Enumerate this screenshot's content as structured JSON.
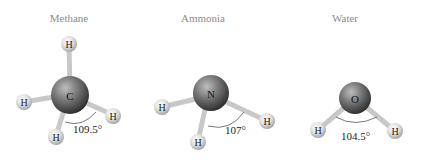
{
  "figure": {
    "molecules": [
      {
        "name": "Methane",
        "central_atom": "C",
        "hydrogen_label": "H",
        "bond_angle": "109.5°",
        "hydrogen_count": 4
      },
      {
        "name": "Ammonia",
        "central_atom": "N",
        "hydrogen_label": "H",
        "bond_angle": "107°",
        "hydrogen_count": 3
      },
      {
        "name": "Water",
        "central_atom": "O",
        "hydrogen_label": "H",
        "bond_angle": "104.5°",
        "hydrogen_count": 2
      }
    ],
    "colors": {
      "central_atom": "#6e6e6e",
      "hydrogen_atom": "#d9d9d9",
      "bond": "#cfcfcf",
      "title_text": "#8a8a8a",
      "label_text": "#1a1a1a"
    }
  }
}
